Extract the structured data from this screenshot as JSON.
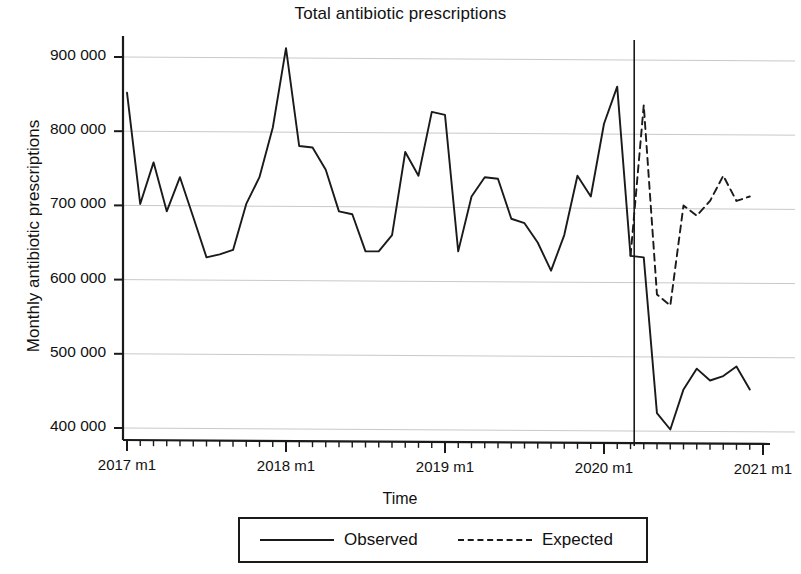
{
  "chart_data": {
    "type": "line",
    "title": "Total antibiotic prescriptions",
    "xlabel": "Time",
    "ylabel": "Monthly antibiotic prescriptions",
    "ylim": [
      380000,
      930000
    ],
    "xlim": [
      2017.0,
      2021.0
    ],
    "grid": true,
    "legend_position": "below-axes",
    "y_ticks": [
      400000,
      500000,
      600000,
      700000,
      800000,
      900000
    ],
    "y_tick_labels": [
      "400 000",
      "500 000",
      "600 000",
      "700 000",
      "800 000",
      "900 000"
    ],
    "x_ticks": [
      2017.0,
      2018.0,
      2019.0,
      2020.0,
      2021.0
    ],
    "x_tick_labels": [
      "2017 m1",
      "2018 m1",
      "2019 m1",
      "2020 m1",
      "2021 m1"
    ],
    "x_minor_tick_interval_months": 1,
    "annotations": [
      {
        "type": "vertical-line",
        "label": "intervention-line",
        "x": 2020.19
      }
    ],
    "series": [
      {
        "name": "Observed",
        "style": "solid",
        "color": "#1a1a1a",
        "x": [
          2017.0,
          2017.083,
          2017.167,
          2017.25,
          2017.333,
          2017.417,
          2017.5,
          2017.583,
          2017.667,
          2017.75,
          2017.833,
          2017.917,
          2018.0,
          2018.083,
          2018.167,
          2018.25,
          2018.333,
          2018.417,
          2018.5,
          2018.583,
          2018.667,
          2018.75,
          2018.833,
          2018.917,
          2019.0,
          2019.083,
          2019.167,
          2019.25,
          2019.333,
          2019.417,
          2019.5,
          2019.583,
          2019.667,
          2019.75,
          2019.833,
          2019.917,
          2020.0,
          2020.083,
          2020.167,
          2020.25,
          2020.333,
          2020.417,
          2020.5,
          2020.583,
          2020.667,
          2020.75,
          2020.833,
          2020.917
        ],
        "values": [
          852000,
          702000,
          758000,
          692000,
          738000,
          684000,
          630000,
          634000,
          640000,
          702000,
          738000,
          805000,
          912000,
          780000,
          778000,
          748000,
          692000,
          688000,
          638000,
          638000,
          660000,
          772000,
          740000,
          826000,
          822000,
          638000,
          712000,
          738000,
          736000,
          682000,
          676000,
          650000,
          612000,
          660000,
          740000,
          712000,
          810000,
          860000,
          632000,
          630000,
          420000,
          398000,
          452000,
          480000,
          464000,
          470000,
          483000,
          452000
        ]
      },
      {
        "name": "Expected",
        "style": "dashed",
        "color": "#1a1a1a",
        "x": [
          2020.167,
          2020.25,
          2020.333,
          2020.417,
          2020.5,
          2020.583,
          2020.667,
          2020.75,
          2020.833,
          2020.917
        ],
        "values": [
          632000,
          835000,
          580000,
          565000,
          700000,
          686000,
          706000,
          740000,
          706000,
          712000
        ]
      }
    ]
  },
  "legend": {
    "items": [
      {
        "label": "Observed",
        "style": "solid"
      },
      {
        "label": "Expected",
        "style": "dashed"
      }
    ]
  }
}
